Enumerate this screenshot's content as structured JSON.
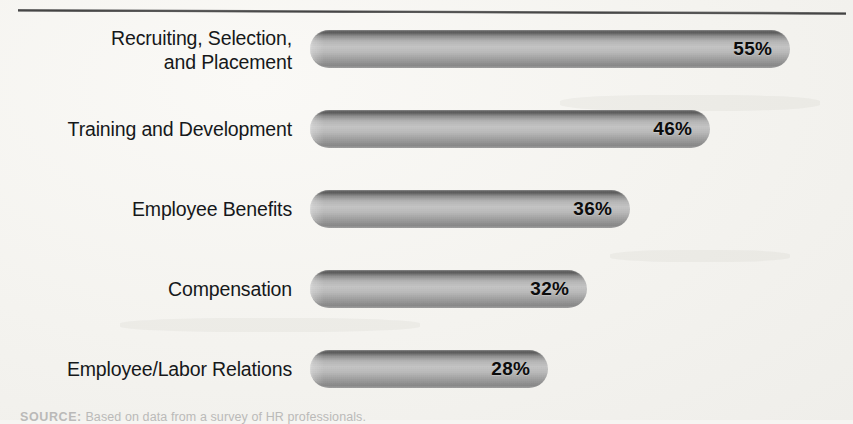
{
  "figure": {
    "background_color": "#f6f5f2",
    "bar_dark_color": "#5e5e5e",
    "bar_light_color": "#c6c6c6",
    "value_text_color": "#0c0c0c",
    "label_text_color": "#16181a"
  },
  "source": {
    "lead": "SOURCE:",
    "text": " Based on data from a survey of HR professionals."
  },
  "chart_data": {
    "type": "bar",
    "orientation": "horizontal",
    "title": "",
    "subtitle": "",
    "xlabel": "",
    "ylabel": "",
    "xlim": [
      0,
      60
    ],
    "grid": false,
    "legend": "none",
    "categories": [
      "Recruiting, Selection,\nand Placement",
      "Training and Development",
      "Employee Benefits",
      "Compensation",
      "Employee/Labor Relations"
    ],
    "values": [
      55,
      46,
      36,
      32,
      28
    ],
    "data_labels": [
      "55%",
      "46%",
      "36%",
      "32%",
      "28%"
    ],
    "bars": [
      {
        "label": "Recruiting, Selection,\nand Placement",
        "value": 55,
        "data_label": "55%",
        "pixel_width": 480
      },
      {
        "label": "Training and Development",
        "value": 46,
        "data_label": "46%",
        "pixel_width": 400
      },
      {
        "label": "Employee Benefits",
        "value": 36,
        "data_label": "36%",
        "pixel_width": 320
      },
      {
        "label": "Compensation",
        "value": 32,
        "data_label": "32%",
        "pixel_width": 277
      },
      {
        "label": "Employee/Labor Relations",
        "value": 28,
        "data_label": "28%",
        "pixel_width": 238
      }
    ]
  }
}
